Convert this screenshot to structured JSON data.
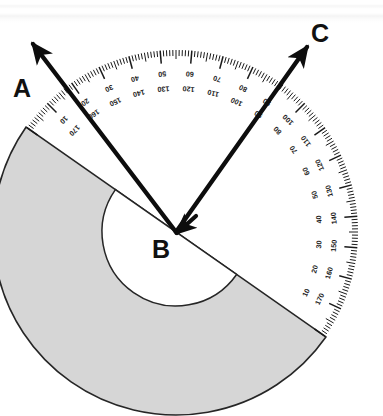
{
  "figure": {
    "kind": "protractor-angle-diagram",
    "background_color": "#ffffff",
    "body_color": "#d6d6d6",
    "edge_color": "#2b2b2b",
    "ray_color": "#0d0d0d"
  },
  "labels": {
    "a": "A",
    "b": "B",
    "c": "C"
  },
  "points": {
    "vertex": {
      "name": "B",
      "x": 176,
      "y": 232
    },
    "ray_a_tip": {
      "name": "A",
      "x": 33,
      "y": 44
    },
    "ray_c_tip": {
      "name": "C",
      "x": 307,
      "y": 47
    }
  },
  "protractor": {
    "center_x": 176,
    "center_y": 232,
    "outer_radius": 183,
    "inner_radius": 92,
    "hole_radius": 74,
    "rotation_degrees": -35,
    "tick_step_degrees": 1,
    "medium_tick_every": 5,
    "major_tick_every": 10
  },
  "scales": {
    "outer_label_values": [
      10,
      20,
      30,
      40,
      50,
      60,
      70,
      80,
      90,
      100,
      110,
      120,
      130,
      140,
      150,
      160,
      170
    ],
    "inner_label_values": [
      170,
      160,
      150,
      140,
      130,
      120,
      110,
      100,
      90,
      80,
      70,
      60,
      50,
      40,
      30,
      20,
      10
    ]
  },
  "measurement": {
    "ray_ba_scale_degrees": 0,
    "ray_bc_scale_degrees": 80,
    "angle_abc_degrees": 80
  }
}
